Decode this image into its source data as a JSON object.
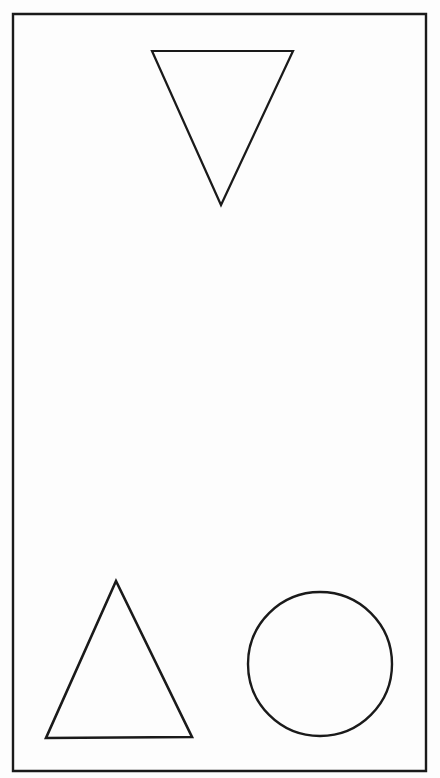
{
  "figure": {
    "title": "Geometric shapes inside a rectangular border",
    "background_color": "#ffffff",
    "ink_color": "#1a1a1a",
    "canvas": {
      "width": 440,
      "height": 778
    }
  },
  "border": {
    "label": "rectangular-frame",
    "shape": "rectangle",
    "x": 13,
    "y": 14,
    "width": 413,
    "height": 757,
    "stroke_width": 2.4,
    "fill": "none"
  },
  "shapes": [
    {
      "id": "inverted-triangle",
      "label": "Downward pointing triangle",
      "type": "triangle",
      "orientation": "down",
      "points": "152,51 293,51 221,205",
      "stroke_width": 2.2,
      "fill": "none",
      "centroid_x": 222,
      "centroid_y": 102
    },
    {
      "id": "upright-triangle",
      "label": "Upward pointing triangle",
      "type": "triangle",
      "orientation": "up",
      "points": "116,581 192,737 46,738",
      "stroke_width": 2.6,
      "fill": "none",
      "centroid_x": 118,
      "centroid_y": 685
    },
    {
      "id": "circle",
      "label": "Circle",
      "type": "circle",
      "cx": 320,
      "cy": 664,
      "r": 72,
      "stroke_width": 2.4,
      "fill": "none"
    }
  ],
  "counts": {
    "shape_total": 3,
    "triangles": 2,
    "circles": 1
  }
}
